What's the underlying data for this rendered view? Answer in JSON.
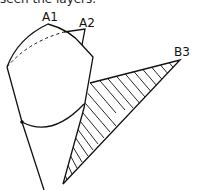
{
  "caption": "seen the layers.",
  "labels": {
    "a1": "A1",
    "a2": "A2",
    "b3": "B3"
  },
  "colors": {
    "stroke": "#111111",
    "background": "#ffffff"
  }
}
